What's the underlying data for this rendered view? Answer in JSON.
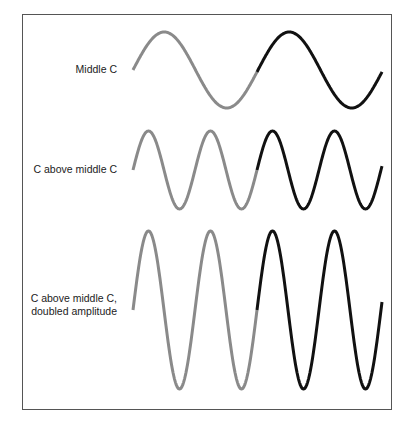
{
  "rows": [
    {
      "label": "Middle C",
      "label_lines": [
        "Middle C"
      ],
      "y_center": 70,
      "amplitude": 38,
      "period": 125
    },
    {
      "label": "C above middle C",
      "label_lines": [
        "C above middle C"
      ],
      "y_center": 170,
      "amplitude": 39,
      "period": 62
    },
    {
      "label": "C above middle C, doubled amplitude",
      "label_lines": [
        "C above middle C,",
        "doubled amplitude"
      ],
      "y_center": 310,
      "amplitude": 79,
      "period": 62
    }
  ],
  "colors": {
    "first_half": "#8a8a8a",
    "second_half": "#111111",
    "frame": "#555555"
  },
  "wave": {
    "x_start": 133,
    "x_split": 257,
    "x_end": 382,
    "stroke_width": 3
  }
}
